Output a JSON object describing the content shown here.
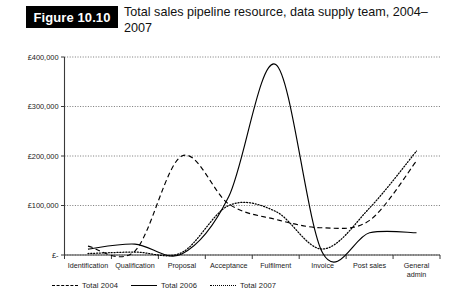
{
  "figure": {
    "badge": "Figure 10.10",
    "title": "Total sales pipeline resource, data supply team, 2004–2007"
  },
  "chart_data": {
    "type": "line",
    "title": "Total sales pipeline resource, data supply team, 2004–2007",
    "xlabel": "",
    "ylabel": "",
    "ylim": [
      0,
      400000
    ],
    "yticks": [
      0,
      100000,
      200000,
      300000,
      400000
    ],
    "ytick_labels": [
      "£-",
      "£100,000",
      "£200,000",
      "£300,000",
      "£400,000"
    ],
    "grid": true,
    "legend_position": "bottom-left",
    "categories": [
      "Identification",
      "Qualification",
      "Proposal",
      "Acceptance",
      "Fulfilment",
      "Invoice",
      "Post sales",
      "General admin"
    ],
    "series": [
      {
        "name": "Total 2004",
        "style": "dashed",
        "color": "#000000",
        "values": [
          18000,
          8000,
          200000,
          103000,
          72000,
          55000,
          70000,
          190000
        ]
      },
      {
        "name": "Total 2006",
        "style": "solid",
        "color": "#000000",
        "values": [
          12000,
          22000,
          2000,
          118000,
          385000,
          4000,
          45000,
          45000
        ]
      },
      {
        "name": "Total 2007",
        "style": "dotted",
        "color": "#000000",
        "values": [
          3000,
          6000,
          5000,
          100000,
          88000,
          12000,
          95000,
          210000
        ]
      }
    ]
  },
  "legend": {
    "items": [
      {
        "label": "Total  2004",
        "style": "dashed"
      },
      {
        "label": "Total 2006",
        "style": "solid"
      },
      {
        "label": "Total 2007",
        "style": "dotted"
      }
    ]
  }
}
